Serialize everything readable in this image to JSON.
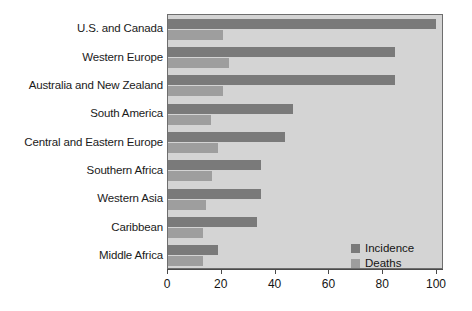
{
  "chart_data": {
    "type": "bar",
    "orientation": "horizontal",
    "title": "",
    "xlabel": "",
    "ylabel": "",
    "xlim": [
      0,
      100
    ],
    "xticks": [
      0,
      20,
      40,
      60,
      80,
      100
    ],
    "grid": false,
    "legend_position": "bottom-right",
    "categories": [
      "U.S. and Canada",
      "Western Europe",
      "Australia and New Zealand",
      "South America",
      "Central and Eastern Europe",
      "Southern Africa",
      "Western Asia",
      "Caribbean",
      "Middle Africa"
    ],
    "series": [
      {
        "name": "Incidence",
        "color": "#7a7a7a",
        "values": [
          99.5,
          84.5,
          84.5,
          46.5,
          43.5,
          34.5,
          34.5,
          33.0,
          18.5
        ]
      },
      {
        "name": "Deaths",
        "color": "#9e9e9e",
        "values": [
          20.5,
          22.5,
          20.5,
          16.0,
          18.5,
          16.5,
          14.0,
          13.0,
          13.0
        ]
      }
    ]
  },
  "legend": {
    "items": [
      {
        "label": "Incidence",
        "color": "#7a7a7a"
      },
      {
        "label": "Deaths",
        "color": "#9e9e9e"
      }
    ]
  },
  "axis": {
    "tick_labels": [
      "0",
      "20",
      "40",
      "60",
      "80",
      "100"
    ]
  },
  "colors": {
    "plot_background": "#d4d4d4",
    "plot_border": "#6e6e6e",
    "incidence": "#7a7a7a",
    "deaths": "#9e9e9e",
    "axis_line": "#4a4a4a",
    "text": "#141414",
    "page_background": "#ffffff"
  }
}
